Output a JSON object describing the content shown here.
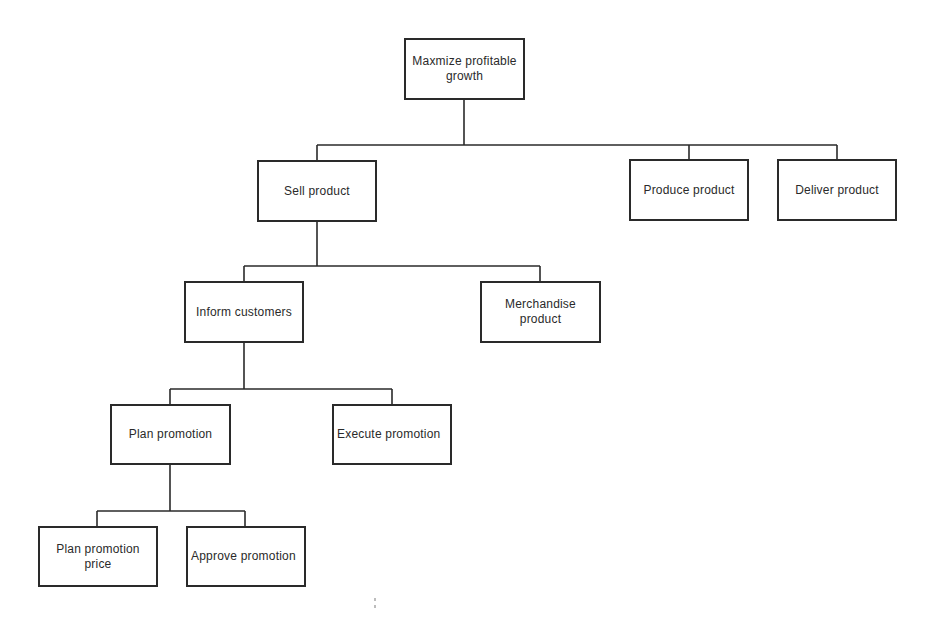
{
  "diagram": {
    "type": "hierarchy-tree",
    "line_color": "#2a2a2a",
    "nodes": {
      "root": {
        "label": "Maxmize profitable growth",
        "x": 404,
        "y": 38,
        "w": 121,
        "h": 62
      },
      "sell": {
        "label": "Sell product",
        "x": 257,
        "y": 160,
        "w": 120,
        "h": 62
      },
      "produce": {
        "label": "Produce product",
        "x": 629,
        "y": 159,
        "w": 120,
        "h": 62
      },
      "deliver": {
        "label": "Deliver product",
        "x": 777,
        "y": 159,
        "w": 120,
        "h": 62
      },
      "inform": {
        "label": "Inform customers",
        "x": 184,
        "y": 281,
        "w": 120,
        "h": 62
      },
      "merchandise": {
        "label": "Merchandise product",
        "x": 480,
        "y": 281,
        "w": 121,
        "h": 62
      },
      "plan": {
        "label": "Plan promotion",
        "x": 110,
        "y": 404,
        "w": 121,
        "h": 61
      },
      "execute": {
        "label": "Execute promotion",
        "x": 332,
        "y": 404,
        "w": 120,
        "h": 61
      },
      "plan_price": {
        "label": "Plan promotion price",
        "x": 38,
        "y": 526,
        "w": 120,
        "h": 61
      },
      "approve": {
        "label": "Approve promotion",
        "x": 186,
        "y": 526,
        "w": 120,
        "h": 61
      }
    },
    "edges": [
      {
        "from": "root",
        "to": [
          "sell",
          "produce",
          "deliver"
        ]
      },
      {
        "from": "sell",
        "to": [
          "inform",
          "merchandise"
        ]
      },
      {
        "from": "inform",
        "to": [
          "plan",
          "execute"
        ]
      },
      {
        "from": "plan",
        "to": [
          "plan_price",
          "approve"
        ]
      }
    ]
  }
}
